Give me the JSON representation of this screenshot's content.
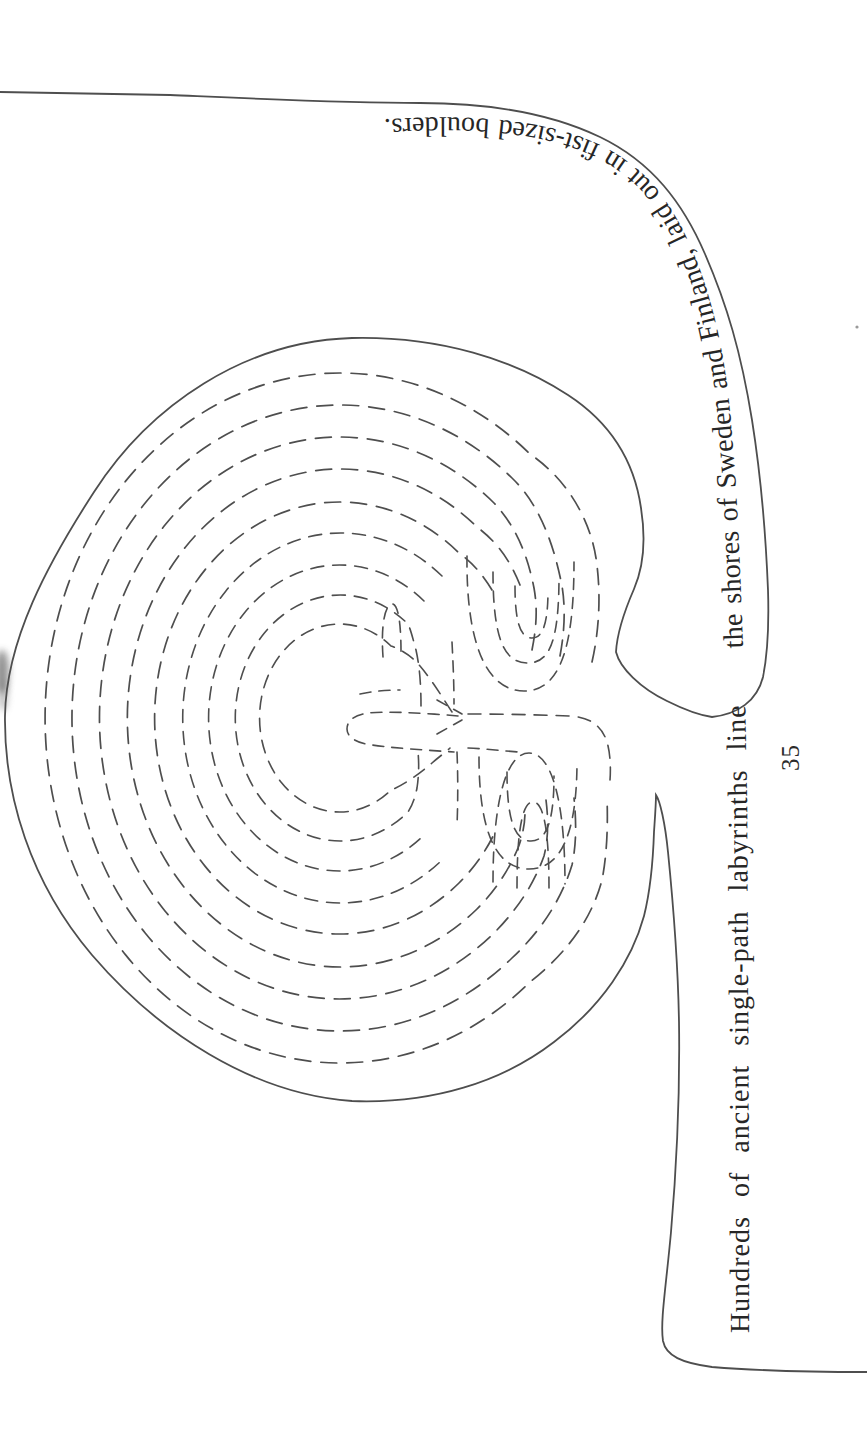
{
  "page": {
    "caption_full": "Hundreds of ancient single-path labyrinths line the shores of Sweden and Finland, laid out in fist-sized boulders.",
    "caption_segment_lower": "Hundreds of ancient single-path labyrinths line",
    "caption_segment_upper": "the shores of Sweden and Finland, laid out in fist-sized boulders.",
    "page_number": "35",
    "colors": {
      "background": "#ffffff",
      "figure_ink": "#4e4e4e",
      "text_ink": "#262626"
    },
    "figure": {
      "name": "stone-labyrinth-diagram",
      "line_style": "dashed walls with solid outer boundary and sweeping entrance tails"
    }
  }
}
